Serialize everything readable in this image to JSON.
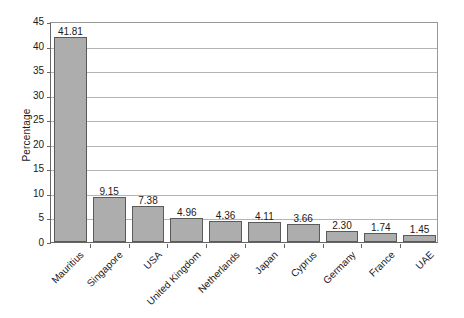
{
  "chart_data": {
    "type": "bar",
    "title": "",
    "subtitle": "",
    "xlabel": "",
    "ylabel": "Percentage",
    "ylim": [
      0,
      45
    ],
    "ytick_step": 5,
    "yticks": [
      "45",
      "40",
      "35",
      "30",
      "25",
      "20",
      "15",
      "10",
      "5",
      "0"
    ],
    "grid": "horizontal",
    "legend": "none",
    "orientation": "vertical",
    "bar_label_format": "two-decimals",
    "categories": [
      "Mauritius",
      "Singapore",
      "USA",
      "United Kingdom",
      "Netherlands",
      "Japan",
      "Cyprus",
      "Germany",
      "France",
      "UAE"
    ],
    "values": [
      41.81,
      9.15,
      7.38,
      4.96,
      4.36,
      4.11,
      3.66,
      2.3,
      1.74,
      1.45
    ],
    "value_labels": [
      "41.81",
      "9.15",
      "7.38",
      "4.96",
      "4.36",
      "4.11",
      "3.66",
      "2.30",
      "1.74",
      "1.45"
    ],
    "series": [
      {
        "name": "Percentage",
        "values": [
          41.81,
          9.15,
          7.38,
          4.96,
          4.36,
          4.11,
          3.66,
          2.3,
          1.74,
          1.45
        ]
      }
    ]
  },
  "style": {
    "bar_fill": "#adadad",
    "bar_stroke": "#5a5a5a",
    "gridline_color": "#b4b4b4",
    "axis_color": "#666666",
    "text_color": "#1a1a1a",
    "background": "#ffffff"
  }
}
